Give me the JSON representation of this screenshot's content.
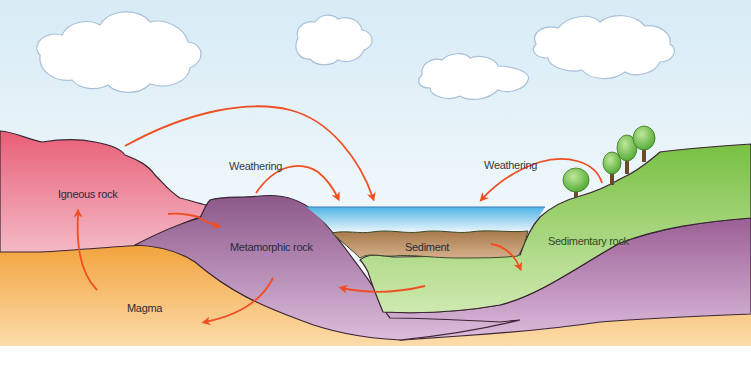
{
  "labels": {
    "igneous_rock": "Igneous rock",
    "metamorphic_rock": "Metamorphic rock",
    "magma": "Magma",
    "sediment": "Sediment",
    "sedimentary_rock": "Sedimentary rock",
    "weathering_left": "Weathering",
    "weathering_right": "Weathering"
  },
  "colors": {
    "sky_top": "#d9ecf6",
    "sky_bottom": "#ffffff",
    "igneous_top": "#e8667a",
    "igneous_bottom": "#f3b1c0",
    "metamorphic_top": "#8e5c8c",
    "metamorphic_bottom": "#d6b5d6",
    "magma_top": "#f2a33a",
    "magma_bottom": "#fbd9a4",
    "sediment": "#b98e61",
    "sedimentary_top": "#76c043",
    "sedimentary_bottom": "#cde8ad",
    "water_top": "#56b7e6",
    "water_bottom": "#e6f4fb",
    "arrow": "#f04e23",
    "outline": "#3a2533",
    "cloud_outline": "#9fb9d4",
    "tree_leaf": "#6abf43",
    "tree_trunk": "#6b4a2a"
  },
  "elements": {
    "clouds": 4,
    "trees": 4,
    "arrows": 9
  }
}
